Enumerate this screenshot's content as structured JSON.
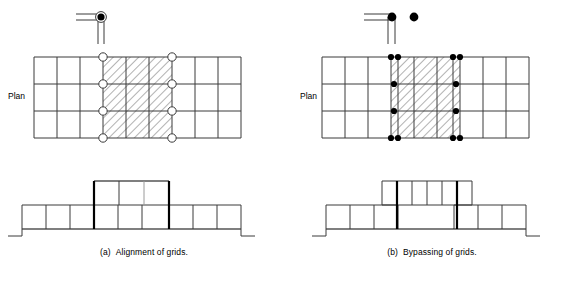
{
  "figure": {
    "panels": [
      {
        "id": "a",
        "caption_tag": "(a)",
        "caption_text": "Alignment of grids.",
        "plan_label": "Plan",
        "key_symbol": {
          "name": "aligned-grid-intersection-symbol",
          "description": "two parallel horizontal grid lines meeting two parallel vertical grid lines at a single ringed node",
          "node_style": "open-ring-with-filled-dot",
          "node_count": 1
        },
        "plan": {
          "columns": 9,
          "rows": 3,
          "hatched_columns": [
            4,
            5,
            6
          ],
          "hatch_angle_deg": 45,
          "node_marker": "open-ring",
          "node_columns": [
            4,
            7
          ],
          "node_rows": 4,
          "node_total": 8
        },
        "elevation": {
          "lower_bays": 9,
          "upper_bays": 3,
          "upper_offset_bays": 3,
          "party_walls_aligned": true,
          "thick_column_lines": 2,
          "base_step": true
        }
      },
      {
        "id": "b",
        "caption_tag": "(b)",
        "caption_text": "Bypassing of grids.",
        "plan_label": "Plan",
        "key_symbol": {
          "name": "bypassing-grid-intersection-symbol",
          "description": "two parallel horizontal grid lines and two parallel vertical grid lines passing each other at two separate solid nodes",
          "node_style": "solid-dot",
          "node_count": 2
        },
        "plan": {
          "columns": 9,
          "rows": 3,
          "hatched_columns": [
            4,
            5,
            6
          ],
          "hatch_angle_deg": 45,
          "node_marker": "solid-dot",
          "node_columns": [
            4,
            7
          ],
          "node_rows": 4,
          "paired_nodes_rows": [
            1,
            4
          ],
          "node_total": 12
        },
        "elevation": {
          "lower_bays": 6,
          "lower_blocks": 2,
          "lower_bays_per_block": 3,
          "upper_bays": 6,
          "party_walls_aligned": false,
          "thick_column_lines": 2,
          "base_step": true
        }
      }
    ],
    "colors": {
      "line": "#000000",
      "grid_line": "#3a3a3a",
      "hatch": "#555555",
      "background": "#ffffff",
      "node_fill": "#000000"
    }
  }
}
